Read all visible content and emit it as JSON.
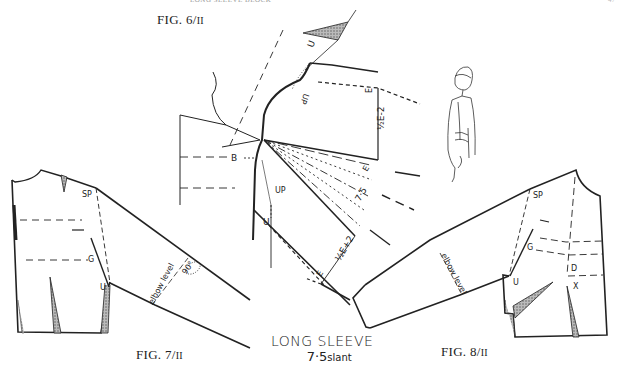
{
  "page": {
    "header_text": "LONG SLEEVE BLOCK",
    "page_number": "47"
  },
  "figures": {
    "fig6": {
      "label": "FIG. 6/",
      "roman": "II"
    },
    "fig7": {
      "label": "FIG. 7/",
      "roman": "II"
    },
    "fig8": {
      "label": "FIG. 8/",
      "roman": "II"
    }
  },
  "caption": {
    "line1": "LONG SLEEVE",
    "line2_number": "7·5",
    "line2_unit": "slant"
  },
  "fig6_labels": {
    "u_top": "U",
    "up_top": "UP",
    "e_top": "E",
    "half_e_minus_2": "½E-2",
    "b": "B",
    "up_bottom": "UP",
    "u_bottom": "U",
    "e_mid": "E",
    "seven_five": "7·5",
    "e_bottom": "E",
    "half_e_plus_2": "½E+2"
  },
  "fig7_labels": {
    "sp": "SP",
    "g": "G",
    "u": "U",
    "elbow_level": "elbow level",
    "angle": "90°"
  },
  "fig8_labels": {
    "sp": "SP",
    "g": "G",
    "u": "U",
    "d": "D",
    "x": "X",
    "elbow_level": "elbow level"
  }
}
